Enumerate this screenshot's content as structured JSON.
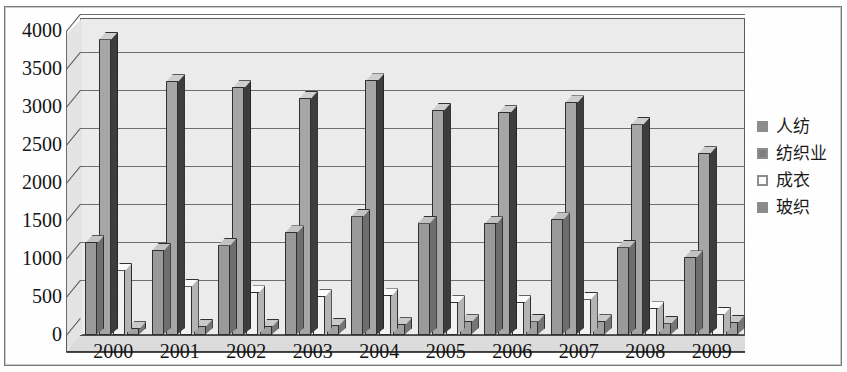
{
  "chart_data": {
    "type": "bar",
    "title": "",
    "subtitle": "",
    "xlabel": "",
    "ylabel": "",
    "categories": [
      "2000",
      "2001",
      "2002",
      "2003",
      "2004",
      "2005",
      "2006",
      "2007",
      "2008",
      "2009"
    ],
    "series": [
      {
        "name": "人纺",
        "color": "#9a9a9a",
        "values": [
          1220,
          1120,
          1190,
          1350,
          1570,
          1480,
          1470,
          1520,
          1160,
          1020
        ]
      },
      {
        "name": "纺织业",
        "color": "#a6a6a6",
        "values": [
          3900,
          3340,
          3260,
          3120,
          3350,
          2960,
          2930,
          3060,
          2780,
          2390
        ]
      },
      {
        "name": "成衣",
        "color": "#f2f2f2",
        "values": [
          860,
          650,
          560,
          510,
          520,
          430,
          430,
          480,
          350,
          280
        ]
      },
      {
        "name": "玻织",
        "color": "#a0a0a0",
        "values": [
          90,
          120,
          120,
          130,
          140,
          180,
          190,
          180,
          160,
          170
        ]
      }
    ],
    "ylim": [
      0,
      4000
    ],
    "ytick_step": 500,
    "yticks": [
      "0",
      "500",
      "1000",
      "1500",
      "2000",
      "2500",
      "3000",
      "3500",
      "4000"
    ],
    "grid": true,
    "legend_position": "right",
    "style": "3d-clustered-column-grayscale"
  },
  "legend": {
    "items": [
      {
        "label": "人纺"
      },
      {
        "label": "纺织业"
      },
      {
        "label": "成衣"
      },
      {
        "label": "玻织"
      }
    ]
  }
}
